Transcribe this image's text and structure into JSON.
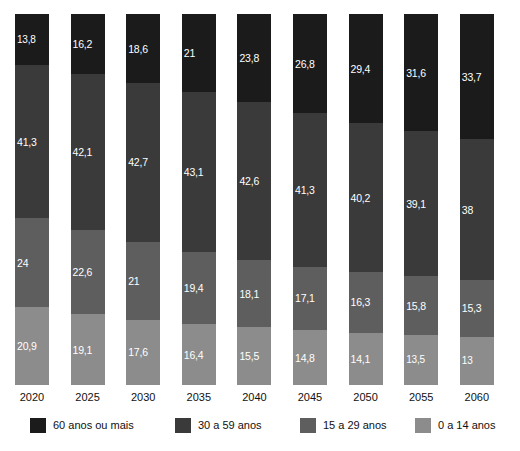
{
  "chart_data": {
    "type": "bar",
    "stacked": true,
    "stack_mode": "percent",
    "title": "",
    "subtitle": "",
    "xlabel": "",
    "ylabel": "",
    "ylim": [
      0,
      100
    ],
    "grid": false,
    "legend_position": "bottom",
    "categories": [
      "2020",
      "2025",
      "2030",
      "2035",
      "2040",
      "2045",
      "2050",
      "2055",
      "2060"
    ],
    "series": [
      {
        "name": "60 anos ou mais",
        "color": "#1b1b1b",
        "values": [
          13.8,
          16.2,
          18.6,
          21,
          23.8,
          26.8,
          29.4,
          31.6,
          33.7
        ],
        "labels": [
          "13,8",
          "16,2",
          "18,6",
          "21",
          "23,8",
          "26,8",
          "29,4",
          "31,6",
          "33,7"
        ]
      },
      {
        "name": "30 a 59 anos",
        "color": "#3a3a3a",
        "values": [
          41.3,
          42.1,
          42.7,
          43.1,
          42.6,
          41.3,
          40.2,
          39.1,
          38
        ],
        "labels": [
          "41,3",
          "42,1",
          "42,7",
          "43,1",
          "42,6",
          "41,3",
          "40,2",
          "39,1",
          "38"
        ]
      },
      {
        "name": "15 a 29 anos",
        "color": "#5e5e5e",
        "values": [
          24,
          22.6,
          21,
          19.4,
          18.1,
          17.1,
          16.3,
          15.8,
          15.3
        ],
        "labels": [
          "24",
          "22,6",
          "21",
          "19,4",
          "18,1",
          "17,1",
          "16,3",
          "15,8",
          "15,3"
        ]
      },
      {
        "name": "0 a 14 anos",
        "color": "#8c8c8c",
        "values": [
          20.9,
          19.1,
          17.6,
          16.4,
          15.5,
          14.8,
          14.1,
          13.5,
          13
        ],
        "labels": [
          "20,9",
          "19,1",
          "17,6",
          "16,4",
          "15,5",
          "14,8",
          "14,1",
          "13,5",
          "13"
        ]
      }
    ]
  },
  "legend": {
    "items": [
      {
        "label": "60 anos ou mais",
        "color": "#1b1b1b"
      },
      {
        "label": "30 a 59 anos",
        "color": "#3a3a3a"
      },
      {
        "label": "15 a 29 anos",
        "color": "#5e5e5e"
      },
      {
        "label": "0 a 14 anos",
        "color": "#8c8c8c"
      }
    ]
  },
  "axis": {
    "x_ticks": [
      "2020",
      "2025",
      "2030",
      "2035",
      "2040",
      "2045",
      "2050",
      "2055",
      "2060"
    ]
  }
}
